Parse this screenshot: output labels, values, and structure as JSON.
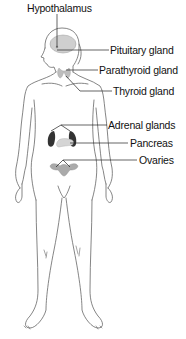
{
  "labels": {
    "hypothalamus": "Hypothalamus",
    "pituitary": "Pituitary gland",
    "parathyroid": "Parathyroid gland",
    "thyroid": "Thyroid gland",
    "adrenal": "Adrenal glands",
    "pancreas": "Pancreas",
    "ovaries": "Ovaries"
  },
  "colors": {
    "outline": "#555555",
    "leader": "#222222",
    "gland_fill": "#c8c8c8",
    "gland_dark": "#555555"
  }
}
